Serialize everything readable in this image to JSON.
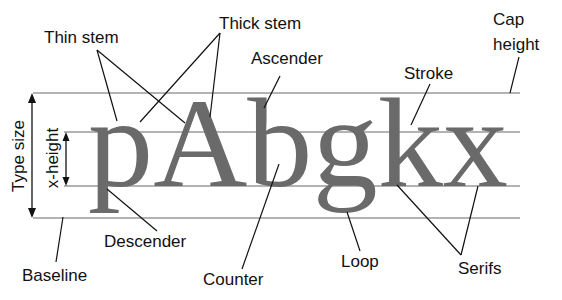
{
  "diagram": {
    "specimen_text": "pAbgkx",
    "colors": {
      "glyph": "#6a6a6a",
      "guide_lines": "#9a9a9a",
      "label_text": "#111111",
      "background": "#ffffff"
    },
    "guide_lines": [
      {
        "name": "cap-height / top",
        "y": 93
      },
      {
        "name": "x-height",
        "y": 132
      },
      {
        "name": "baseline",
        "y": 186
      },
      {
        "name": "descender line",
        "y": 218
      }
    ],
    "dimensions": {
      "type_size": "Type size",
      "x_height": "x-height"
    },
    "labels": {
      "thin_stem": "Thin stem",
      "thick_stem": "Thick stem",
      "ascender": "Ascender",
      "cap_height_line1": "Cap",
      "cap_height_line2": "height",
      "stroke": "Stroke",
      "descender": "Descender",
      "baseline": "Baseline",
      "counter": "Counter",
      "loop": "Loop",
      "serifs": "Serifs"
    }
  }
}
